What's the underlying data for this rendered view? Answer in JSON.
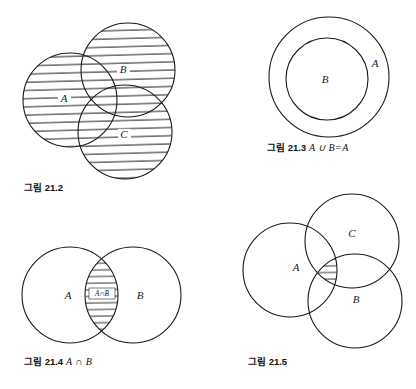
{
  "page": {
    "background_color": "#ffffff",
    "stroke_color": "#1a1a1a",
    "hatch_color": "#2b2b2b",
    "width": 416,
    "height": 389
  },
  "figures": [
    {
      "id": "fig-21-2",
      "caption_ko": "그림",
      "caption_number": "21.2",
      "caption_math": "",
      "caption_full": "그림 21.2",
      "description": "Three overlapping circles A, B, C, all fully hatched (union shading)",
      "labels": [
        {
          "name": "A",
          "x": 64,
          "y": 101
        },
        {
          "name": "B",
          "x": 123,
          "y": 72
        },
        {
          "name": "C",
          "x": 124,
          "y": 137
        }
      ],
      "circles": [
        {
          "name": "A",
          "cx": 70,
          "cy": 100,
          "r": 47,
          "shaded": true
        },
        {
          "name": "B",
          "cx": 128,
          "cy": 70,
          "r": 47,
          "shaded": true
        },
        {
          "name": "C",
          "cx": 125,
          "cy": 132,
          "r": 47,
          "shaded": true
        }
      ]
    },
    {
      "id": "fig-21-3",
      "caption_ko": "그림",
      "caption_number": "21.3",
      "caption_math": "A ∪ B=A",
      "caption_full": "그림 21.3 A ∪ B=A",
      "description": "Circle B fully contained inside circle A; no shading",
      "labels": [
        {
          "name": "A",
          "x": 375,
          "y": 63
        },
        {
          "name": "B",
          "x": 325,
          "y": 82
        }
      ],
      "circles": [
        {
          "name": "A",
          "cx": 329,
          "cy": 77,
          "r": 60,
          "shaded": false
        },
        {
          "name": "B",
          "cx": 327,
          "cy": 79,
          "r": 41,
          "shaded": false
        }
      ]
    },
    {
      "id": "fig-21-4",
      "caption_ko": "그림",
      "caption_number": "21.4",
      "caption_math": "A ∩ B",
      "caption_full": "그림 21.4 A ∩ B",
      "description": "Two overlapping circles A and B with the narrow lens intersection hatched and labelled",
      "labels": [
        {
          "name": "A",
          "x": 68,
          "y": 298
        },
        {
          "name": "B",
          "x": 140,
          "y": 298
        }
      ],
      "lens_label": "A∩B",
      "circles": [
        {
          "name": "A",
          "cx": 70,
          "cy": 295,
          "r": 48,
          "shaded": false
        },
        {
          "name": "B",
          "cx": 133,
          "cy": 295,
          "r": 48,
          "shaded": false
        }
      ]
    },
    {
      "id": "fig-21-5",
      "caption_ko": "그림",
      "caption_number": "21.5",
      "caption_math": "",
      "caption_full": "그림 21.5",
      "description": "Three overlapping circles A, B, C with only the central triple-intersection hatched",
      "labels": [
        {
          "name": "A",
          "x": 296,
          "y": 267
        },
        {
          "name": "B",
          "x": 356,
          "y": 299
        },
        {
          "name": "C",
          "x": 352,
          "y": 233
        }
      ],
      "circles": [
        {
          "name": "A",
          "cx": 290,
          "cy": 270,
          "r": 47,
          "shaded": false
        },
        {
          "name": "C",
          "cx": 352,
          "cy": 241,
          "r": 47,
          "shaded": false
        },
        {
          "name": "B",
          "cx": 355,
          "cy": 301,
          "r": 47,
          "shaded": false
        }
      ]
    }
  ],
  "captions": [
    {
      "id": "caption-21-2",
      "ko": "그림",
      "num": "21.2",
      "math": "",
      "x": 24,
      "y": 186
    },
    {
      "id": "caption-21-3",
      "ko": "그림",
      "num": "21.3",
      "math": "A ∪ B=A",
      "x": 267,
      "y": 146
    },
    {
      "id": "caption-21-4",
      "ko": "그림",
      "num": "21.4",
      "math": "A ∩ B",
      "x": 24,
      "y": 360
    },
    {
      "id": "caption-21-5",
      "ko": "그림",
      "num": "21.5",
      "math": "",
      "x": 248,
      "y": 360
    }
  ]
}
